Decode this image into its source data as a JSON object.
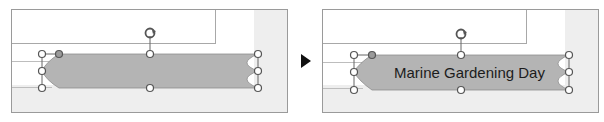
{
  "steps": [
    {
      "id": "before",
      "shape_text": "",
      "shape_fill": "#b4b4b4",
      "handles": "selection-handles",
      "rotation_handle": "rotate-icon"
    },
    {
      "id": "after",
      "shape_text": "Marine Gardening Day",
      "shape_fill": "#b4b4b4",
      "handles": "selection-handles",
      "rotation_handle": "rotate-icon"
    }
  ],
  "transition_icon": "play-arrow-icon",
  "colors": {
    "shape_fill": "#b4b4b4",
    "handle_fill": "#ffffff",
    "handle_stroke": "#555555",
    "adjust_handle_fill": "#9a9a9a",
    "panel_border": "#9a9a9a",
    "panel_gray": "#eeeeee"
  }
}
